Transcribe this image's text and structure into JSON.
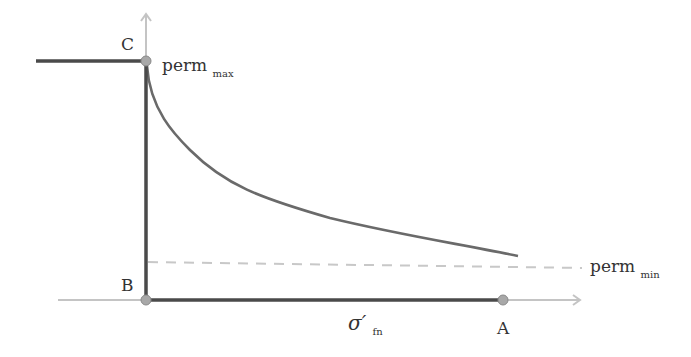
{
  "diagram": {
    "type": "permeability-vs-effective-normal-stress",
    "points": {
      "A": {
        "label": "A"
      },
      "B": {
        "label": "B"
      },
      "C": {
        "label": "C"
      }
    },
    "labels": {
      "perm_max_main": "perm",
      "perm_max_sub": "max",
      "perm_min_main": "perm",
      "perm_min_sub": "min",
      "x_axis_main": "σ′",
      "x_axis_sub": "fn"
    },
    "colors": {
      "axis": "#c4c4c4",
      "path": "#4a4a4a",
      "curve": "#6a6a6a",
      "dashed": "#c8c8c8",
      "point_fill": "#a8a8a8",
      "text": "#333333"
    }
  }
}
